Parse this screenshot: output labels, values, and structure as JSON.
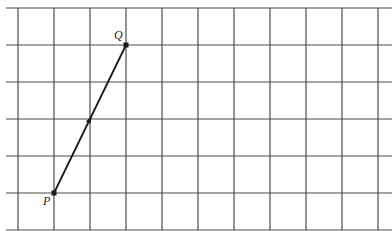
{
  "diagram": {
    "type": "vector-on-grid",
    "grid": {
      "x_lines": [
        18,
        54,
        90,
        126,
        162,
        198,
        234,
        270,
        306,
        342,
        378
      ],
      "y_lines": [
        8,
        45,
        82,
        119,
        156,
        193,
        230
      ],
      "h_line_start": 6,
      "h_line_end": 392,
      "cell_size": "1 unit"
    },
    "points": [
      {
        "label": "P",
        "x": 54,
        "y": 193,
        "grid_col": 1,
        "grid_row": 5,
        "label_dx": -11,
        "label_dy": 12
      },
      {
        "label": "Q",
        "x": 126,
        "y": 45,
        "grid_col": 3,
        "grid_row": 1,
        "label_dx": -12,
        "label_dy": -6
      }
    ],
    "vector": {
      "from": "P",
      "to": "Q",
      "arrow_at": "midpoint",
      "displacement": "2 right, 4 up"
    },
    "colors": {
      "grid": "#4a4a4a",
      "line": "#1a1a1a",
      "background": "#ffffff"
    }
  }
}
